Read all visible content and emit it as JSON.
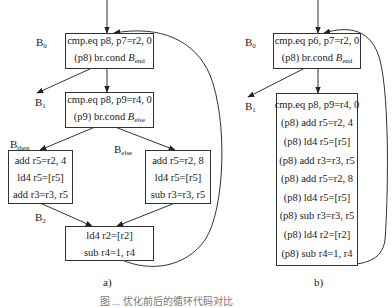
{
  "diagram_a": {
    "caption": "a)",
    "labels": {
      "b0": {
        "main": "B",
        "sub": "0"
      },
      "b1": {
        "main": "B",
        "sub": "1"
      },
      "bthen": {
        "main": "B",
        "sub": "then"
      },
      "belse": {
        "main": "B",
        "sub": "else"
      },
      "b2": {
        "main": "B",
        "sub": "2"
      }
    },
    "blocks": {
      "b0": {
        "lines": [
          "cmp.eq p8, p7=r2, 0"
        ],
        "branch": {
          "prefix": "(p8) br.cond ",
          "target": "B",
          "target_sub": "end"
        }
      },
      "cond": {
        "lines": [
          "cmp.eq p8, p9=r4, 0"
        ],
        "branch": {
          "prefix": "(p9) br.cond ",
          "target": "B",
          "target_sub": "else"
        }
      },
      "then": {
        "lines": [
          "add r5=r2, 4",
          "ld4 r5=[r5]",
          "add r3=r3, r5"
        ]
      },
      "else": {
        "lines": [
          "add r5=r2, 8",
          "ld4 r5=[r5]",
          "sub r3=r3, r5"
        ]
      },
      "b2": {
        "lines": [
          "ld4 r2=[r2]",
          "sub r4=1, r4"
        ]
      }
    }
  },
  "diagram_b": {
    "caption": "b)",
    "labels": {
      "b0": {
        "main": "B",
        "sub": "0"
      },
      "b1": {
        "main": "B",
        "sub": "1"
      }
    },
    "blocks": {
      "b0": {
        "lines": [
          "cmp.eq p6, p7=r2, 0"
        ],
        "branch": {
          "prefix": "(p8) br.cond ",
          "target": "B",
          "target_sub": "end"
        }
      },
      "body": {
        "lines": [
          "cmp.eq p8, p9=r4, 0",
          "(p8) add r5=r2, 4",
          "(p8) ld4 r5=[r5]",
          "(p8) add r3=r3, r5",
          "(p8) add r5=r2, 8",
          "(p8) ld4 r5=[r5]",
          "(p8) sub r3=r3, r5",
          "(p8) ld4 r2=[r2]",
          "(p8) sub r4=1, r4"
        ]
      }
    }
  },
  "figure_caption": "图 ...  优化前后的循环代码对比",
  "colors": {
    "line": "#333333",
    "text": "#1a1a1a",
    "background": "#ffffff"
  }
}
